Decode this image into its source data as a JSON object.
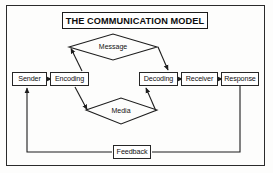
{
  "diagram": {
    "title": "THE COMMUNICATION MODEL",
    "nodes": {
      "sender": "Sender",
      "encoding": "Encoding",
      "decoding": "Decoding",
      "receiver": "Receiver",
      "response": "Response",
      "feedback": "Feedback"
    },
    "channels": {
      "message": "Message",
      "media": "Media"
    },
    "colors": {
      "line": "#262626",
      "background": "#fdfdfc",
      "text": "#111111"
    }
  }
}
